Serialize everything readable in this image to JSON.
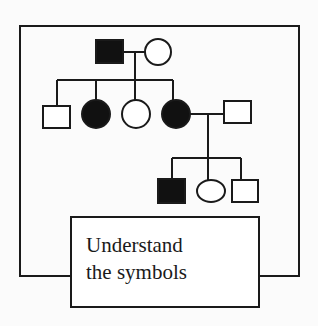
{
  "diagram": {
    "type": "pedigree",
    "label": {
      "line1": "Understand",
      "line2": "the symbols"
    },
    "legend_semantics": {
      "square": "male",
      "circle": "female",
      "filled": "affected",
      "open": "unaffected"
    },
    "generations": [
      {
        "id": "I",
        "members": [
          {
            "id": "I-1",
            "sex": "male",
            "affected": true
          },
          {
            "id": "I-2",
            "sex": "female",
            "affected": false
          }
        ]
      },
      {
        "id": "II",
        "members": [
          {
            "id": "II-1",
            "sex": "male",
            "affected": false
          },
          {
            "id": "II-2",
            "sex": "female",
            "affected": true
          },
          {
            "id": "II-3",
            "sex": "female",
            "affected": false
          },
          {
            "id": "II-4",
            "sex": "female",
            "affected": true
          },
          {
            "id": "II-5",
            "sex": "male",
            "affected": false,
            "note": "spouse of II-4"
          }
        ]
      },
      {
        "id": "III",
        "members": [
          {
            "id": "III-1",
            "sex": "male",
            "affected": true
          },
          {
            "id": "III-2",
            "sex": "female",
            "affected": false
          },
          {
            "id": "III-3",
            "sex": "male",
            "affected": false
          }
        ]
      }
    ],
    "colors": {
      "stroke": "#1a1a1a",
      "fill_affected": "#111111",
      "fill_unaffected": "#ffffff",
      "background": "#fbfbfb"
    }
  }
}
